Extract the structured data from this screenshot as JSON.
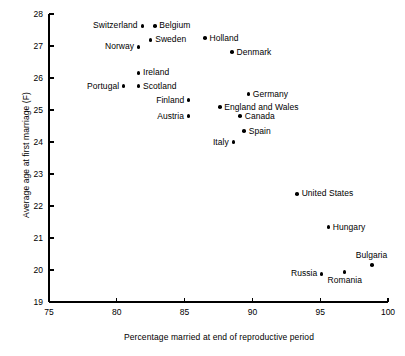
{
  "chart_data": {
    "type": "scatter",
    "title": "",
    "xlabel": "Percentage married at end of reproductive period",
    "ylabel": "Average age at first marriage (F)",
    "xlim": [
      75,
      100
    ],
    "ylim": [
      19,
      28
    ],
    "xticks": [
      75,
      80,
      85,
      90,
      95,
      100
    ],
    "yticks": [
      19,
      20,
      21,
      22,
      23,
      24,
      25,
      26,
      27,
      28
    ],
    "grid": false,
    "legend": "none",
    "marker": "filled-circle",
    "marker_color": "#000000",
    "points": [
      {
        "label": "Switzerland",
        "x": 81.9,
        "y": 27.63,
        "label_pos": "left"
      },
      {
        "label": "Belgium",
        "x": 82.8,
        "y": 27.63,
        "label_pos": "right"
      },
      {
        "label": "Sweden",
        "x": 82.5,
        "y": 27.19,
        "label_pos": "right"
      },
      {
        "label": "Norway",
        "x": 81.6,
        "y": 26.97,
        "label_pos": "left"
      },
      {
        "label": "Holland",
        "x": 86.5,
        "y": 27.25,
        "label_pos": "right"
      },
      {
        "label": "Denmark",
        "x": 88.5,
        "y": 26.81,
        "label_pos": "right"
      },
      {
        "label": "Ireland",
        "x": 81.6,
        "y": 26.16,
        "label_pos": "right"
      },
      {
        "label": "Portugal",
        "x": 80.5,
        "y": 25.75,
        "label_pos": "left"
      },
      {
        "label": "Scotland",
        "x": 81.6,
        "y": 25.75,
        "label_pos": "right"
      },
      {
        "label": "Finland",
        "x": 85.3,
        "y": 25.31,
        "label_pos": "left"
      },
      {
        "label": "Austria",
        "x": 85.3,
        "y": 24.81,
        "label_pos": "left"
      },
      {
        "label": "Germany",
        "x": 89.7,
        "y": 25.5,
        "label_pos": "right"
      },
      {
        "label": "England and Wales",
        "x": 87.6,
        "y": 25.09,
        "label_pos": "right"
      },
      {
        "label": "Canada",
        "x": 89.1,
        "y": 24.81,
        "label_pos": "right"
      },
      {
        "label": "Spain",
        "x": 89.4,
        "y": 24.34,
        "label_pos": "right"
      },
      {
        "label": "Italy",
        "x": 88.6,
        "y": 24.0,
        "label_pos": "left"
      },
      {
        "label": "United States",
        "x": 93.3,
        "y": 22.38,
        "label_pos": "right"
      },
      {
        "label": "Hungary",
        "x": 95.6,
        "y": 21.34,
        "label_pos": "right"
      },
      {
        "label": "Bulgaria",
        "x": 98.8,
        "y": 20.16,
        "label_pos": "above"
      },
      {
        "label": "Russia",
        "x": 95.1,
        "y": 19.88,
        "label_pos": "left"
      },
      {
        "label": "Romania",
        "x": 96.8,
        "y": 19.94,
        "label_pos": "below"
      }
    ]
  },
  "axis": {
    "x_tick_labels": [
      "75",
      "80",
      "85",
      "90",
      "95",
      "100"
    ],
    "y_tick_labels": [
      "19",
      "20",
      "21",
      "22",
      "23",
      "24",
      "25",
      "26",
      "27",
      "28"
    ]
  },
  "colors": {
    "background": "#ffffff",
    "foreground": "#000000",
    "marker": "#000000"
  }
}
